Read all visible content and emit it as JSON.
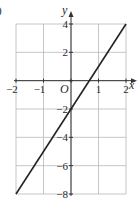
{
  "corner_label": ")",
  "chart_data": {
    "type": "line",
    "title": "",
    "xlabel": "x",
    "ylabel": "y",
    "origin_label": "O",
    "xlim": [
      -2,
      2
    ],
    "ylim": [
      -8,
      4
    ],
    "grid": true,
    "x_ticks": [
      -2,
      -1,
      0,
      1,
      2
    ],
    "x_tick_labels": [
      "−2",
      "−1",
      "",
      "1",
      "2"
    ],
    "y_ticks": [
      4,
      2,
      0,
      -2,
      -4,
      -6,
      -8
    ],
    "y_tick_labels": [
      "4",
      "2",
      "",
      "−2",
      "−4",
      "−6",
      "−8"
    ],
    "series": [
      {
        "name": "y = 3x − 2",
        "x": [
          -2,
          2
        ],
        "y": [
          -8,
          4
        ],
        "color": "#222222"
      }
    ],
    "legend": null
  },
  "colors": {
    "grid": "#b8b8b8",
    "axis": "#333333",
    "line": "#222222"
  }
}
